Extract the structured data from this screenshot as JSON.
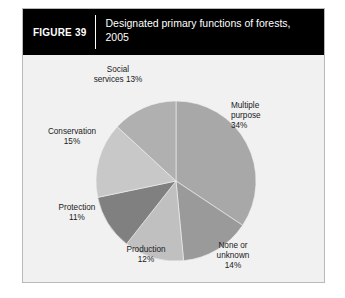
{
  "figure": {
    "number_label": "FIGURE 39",
    "title": "Designated primary functions of forests, 2005"
  },
  "chart_data": {
    "type": "pie",
    "title": "Designated primary functions of forests, 2005",
    "unit": "percent",
    "start_angle_deg": 0,
    "direction": "clockwise",
    "categories": [
      "Multiple purpose",
      "None or unknown",
      "Production",
      "Protection",
      "Conservation",
      "Social services"
    ],
    "values": [
      34,
      14,
      12,
      11,
      15,
      13
    ],
    "colors": [
      "#a8a8a8",
      "#9a9a9a",
      "#c0c0c0",
      "#808080",
      "#c8c8c8",
      "#b0b0b0"
    ],
    "slices": [
      {
        "name": "Multiple purpose",
        "value": 34,
        "color": "#a8a8a8",
        "label_text": "Multiple\npurpose\n34%"
      },
      {
        "name": "None or unknown",
        "value": 14,
        "color": "#9a9a9a",
        "label_text": "None or\nunknown\n14%"
      },
      {
        "name": "Production",
        "value": 12,
        "color": "#c0c0c0",
        "label_text": "Production\n12%"
      },
      {
        "name": "Protection",
        "value": 11,
        "color": "#808080",
        "label_text": "Protection\n11%"
      },
      {
        "name": "Conservation",
        "value": 15,
        "color": "#c8c8c8",
        "label_text": "Conservation\n15%"
      },
      {
        "name": "Social services",
        "value": 13,
        "color": "#b0b0b0",
        "label_text": "Social\nservices 13%"
      }
    ],
    "legend": "none",
    "grid": false
  }
}
